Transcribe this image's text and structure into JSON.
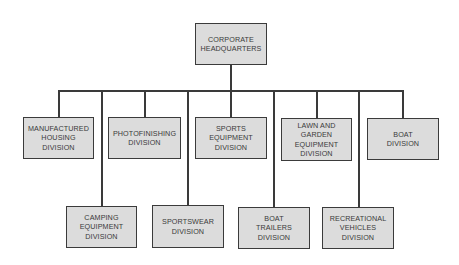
{
  "diagram": {
    "type": "org-chart",
    "root": {
      "id": "hq",
      "label": "CORPORATE\nHEADQUARTERS"
    },
    "divisions": [
      {
        "id": "manufactured-housing",
        "label": "MANUFACTURED\nHOUSING\nDIVISION",
        "row": "upper"
      },
      {
        "id": "camping-equipment",
        "label": "CAMPING\nEQUIPMENT\nDIVISION",
        "row": "lower"
      },
      {
        "id": "photofinishing",
        "label": "PHOTOFINISHING\nDIVISION",
        "row": "upper"
      },
      {
        "id": "sportswear",
        "label": "SPORTSWEAR\nDIVISION",
        "row": "lower"
      },
      {
        "id": "sports-equipment",
        "label": "SPORTS\nEQUIPMENT\nDIVISION",
        "row": "upper"
      },
      {
        "id": "boat-trailers",
        "label": "BOAT\nTRAILERS\nDIVISION",
        "row": "lower"
      },
      {
        "id": "lawn-garden-equipment",
        "label": "LAWN AND\nGARDEN\nEQUIPMENT\nDIVISION",
        "row": "upper"
      },
      {
        "id": "recreational-vehicles",
        "label": "RECREATIONAL\nVEHICLES\nDIVISION",
        "row": "lower"
      },
      {
        "id": "boat",
        "label": "BOAT\nDIVISION",
        "row": "upper"
      }
    ],
    "colors": {
      "box_fill": "#dcdcdc",
      "box_border": "#3b3b3b",
      "line": "#3a3a3a",
      "text": "#3a3a3a",
      "background": "#ffffff"
    }
  }
}
